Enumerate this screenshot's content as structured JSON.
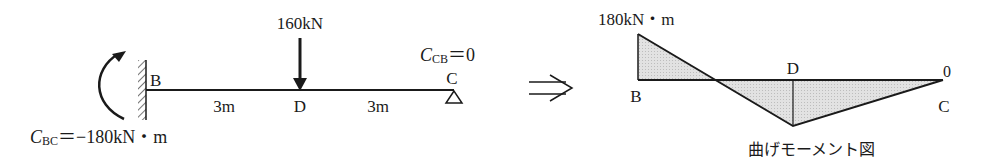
{
  "beam": {
    "load_label": "160kN",
    "node_b": "B",
    "node_c": "C",
    "node_d": "D",
    "span_bd": "3m",
    "span_dc": "3m",
    "moment_b_symbol": "C",
    "moment_b_sub": "BC",
    "moment_b_value": "＝−180kN・m",
    "moment_c_symbol": "C",
    "moment_c_sub": "CB",
    "moment_c_value": "＝0"
  },
  "arrow": "⇒",
  "moment_diagram": {
    "max_label": "180kN・m",
    "node_b": "B",
    "node_d": "D",
    "node_c": "C",
    "zero_label": "0",
    "caption": "曲げモーメント図"
  },
  "colors": {
    "line": "#1a1a1a",
    "fill": "#d9d9d9"
  }
}
